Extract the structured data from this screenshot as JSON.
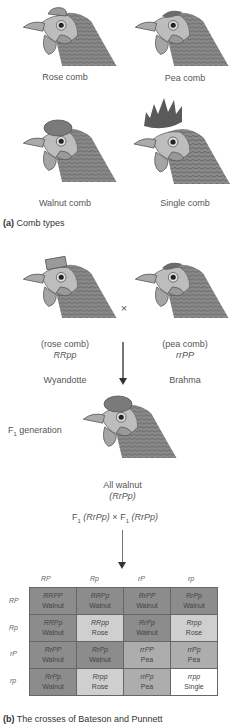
{
  "panel_a": {
    "combs": [
      {
        "label": "Rose comb"
      },
      {
        "label": "Pea comb"
      },
      {
        "label": "Walnut comb"
      },
      {
        "label": "Single comb"
      }
    ],
    "caption_letter": "(a)",
    "caption_text": "Comb types"
  },
  "panel_b": {
    "parent1": {
      "phenotype": "(rose comb)",
      "genotype": "RRpp",
      "breed": "Wyandotte"
    },
    "parent2": {
      "phenotype": "(pea comb)",
      "genotype": "rrPP",
      "breed": "Brahma"
    },
    "cross_symbol": "×",
    "f1_label_prefix": "F",
    "f1_label_sub": "1",
    "f1_label_suffix": " generation",
    "f1_result": "All walnut",
    "f1_genotype": "(RrPp)",
    "f1_cross": {
      "left_prefix": "F",
      "left_sub": "1",
      "left_genotype": "(RrPp)",
      "times": "×",
      "right_prefix": "F",
      "right_sub": "1",
      "right_genotype": "(RrPp)"
    },
    "punnett": {
      "col_headers": [
        "RP",
        "Rp",
        "rP",
        "rp"
      ],
      "row_headers": [
        "RP",
        "Rp",
        "rP",
        "rp"
      ],
      "rows": [
        [
          {
            "g": "RRPP",
            "p": "Walnut"
          },
          {
            "g": "RRPp",
            "p": "Walnut"
          },
          {
            "g": "RrPP",
            "p": "Walnut"
          },
          {
            "g": "RrPp",
            "p": "Walnut"
          }
        ],
        [
          {
            "g": "RRPp",
            "p": "Walnut"
          },
          {
            "g": "RRpp",
            "p": "Rose"
          },
          {
            "g": "RrPp",
            "p": "Walnut"
          },
          {
            "g": "Rrpp",
            "p": "Rose"
          }
        ],
        [
          {
            "g": "RrPP",
            "p": "Walnut"
          },
          {
            "g": "RrPp",
            "p": "Walnut"
          },
          {
            "g": "rrPP",
            "p": "Pea"
          },
          {
            "g": "rrPp",
            "p": "Pea"
          }
        ],
        [
          {
            "g": "RrPp",
            "p": "Walnut"
          },
          {
            "g": "Rrpp",
            "p": "Rose"
          },
          {
            "g": "rrPp",
            "p": "Pea"
          },
          {
            "g": "rrpp",
            "p": "Single"
          }
        ]
      ]
    },
    "caption_letter": "(b)",
    "caption_text": "The crosses of Bateson and Punnett"
  },
  "colors": {
    "walnut": "#8c8c8c",
    "rose": "#cfcfcf",
    "pea": "#adadad",
    "single": "#ffffff"
  }
}
